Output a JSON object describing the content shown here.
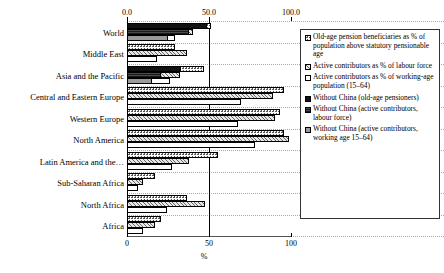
{
  "chart_data": {
    "type": "bar",
    "orientation": "horizontal",
    "title": "",
    "xlabel": "%",
    "ylabel": "",
    "xlim": [
      0,
      100
    ],
    "grid": true,
    "legend_position": "right",
    "top_ticks": [
      "0.0",
      "50.0",
      "100.0"
    ],
    "bottom_ticks": [
      "0",
      "50",
      "100"
    ],
    "categories": [
      "World",
      "Middle East",
      "Asia and the Pacific",
      "Central and Eastern Europe",
      "Western Europe",
      "North America",
      "Latin America and the…",
      "Sub-Saharan Africa",
      "North Africa",
      "Africa"
    ],
    "series": [
      {
        "name": "Old-age pension beneficiaries as % of population above statutory pensionable age",
        "key": "s0",
        "values": [
          51.5,
          29.5,
          47.0,
          95.5,
          93.5,
          96.0,
          55.5,
          17.0,
          36.5,
          21.0
        ]
      },
      {
        "name": "Active contributors as % of labour force",
        "key": "s1",
        "values": [
          40.0,
          36.5,
          32.5,
          89.0,
          90.0,
          99.0,
          37.5,
          9.5,
          47.5,
          17.0
        ]
      },
      {
        "name": "Active contributors as % of working-age population (15–64)",
        "key": "s2",
        "values": [
          29.0,
          18.5,
          26.0,
          69.5,
          67.5,
          78.0,
          27.5,
          6.5,
          24.5,
          9.5
        ]
      },
      {
        "name": "Without China (old-age pensioners)",
        "key": "s3",
        "values": [
          48.5,
          null,
          33.0,
          null,
          null,
          null,
          null,
          null,
          null,
          null
        ]
      },
      {
        "name": "Without China (active contributors, labour force)",
        "key": "s4",
        "values": [
          37.5,
          null,
          21.0,
          null,
          null,
          null,
          null,
          null,
          null,
          null
        ]
      },
      {
        "name": "Without China (active contributors, working age 15–64)",
        "key": "s5",
        "values": [
          25.0,
          null,
          15.0,
          null,
          null,
          null,
          null,
          null,
          null,
          null
        ]
      }
    ]
  },
  "axis": {
    "unit": "%",
    "top_0": "0.0",
    "top_50": "50.0",
    "top_100": "100.0",
    "bot_0": "0",
    "bot_50": "50",
    "bot_100": "100"
  },
  "categories": {
    "c0": "World",
    "c1": "Middle East",
    "c2": "Asia and the Pacific",
    "c3": "Central and Eastern Europe",
    "c4": "Western Europe",
    "c5": "North America",
    "c6": "Latin America and the…",
    "c7": "Sub-Saharan Africa",
    "c8": "North Africa",
    "c9": "Africa"
  },
  "legend": {
    "items": [
      {
        "swatch": "s0",
        "label": "Old-age pension beneficiaries as % of population above statutory pensionable age"
      },
      {
        "swatch": "s1",
        "label": "Active contributors as % of labour force"
      },
      {
        "swatch": "s2",
        "label": "Active contributors as % of working-age population (15–64)"
      },
      {
        "swatch": "s3",
        "label": "Without China (old-age pensioners)"
      },
      {
        "swatch": "s4",
        "label": "Without China (active contributors, labour force)"
      },
      {
        "swatch": "s5",
        "label": "Without China (active contributors, working age 15–64)"
      }
    ]
  },
  "colors": {
    "axis": "#000000",
    "grid": "#aaaaaa",
    "solid_black": "#111111",
    "dark_grey": "#4a4a4a",
    "mid_grey": "#9a9a9a",
    "text": "#000000"
  }
}
